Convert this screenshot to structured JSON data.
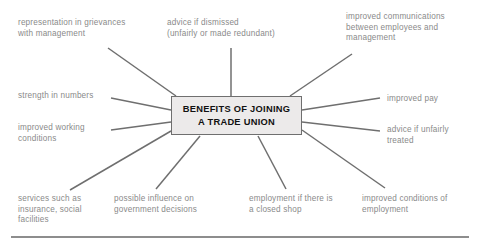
{
  "diagram": {
    "type": "spider-mind-map",
    "center": {
      "title": "BENEFITS OF JOINING\nA TRADE UNION",
      "fill_color": "#eceaea",
      "border_color": "#6f6f6f",
      "text_color": "#111111"
    },
    "style": {
      "label_color": "#8a8a8a",
      "connector_color": "#6f6f6f",
      "background_color": "#ffffff",
      "rule_color": "#8d8d8d"
    },
    "branches": [
      {
        "id": "representation-in-grievances",
        "label": "representation in grievances\nwith management",
        "position": "top-left",
        "x": 18,
        "y": 18,
        "line": {
          "x1": 108,
          "y1": 48,
          "x2": 176,
          "y2": 96
        }
      },
      {
        "id": "advice-if-dismissed",
        "label": "advice if dismissed\n(unfairly or made redundant)",
        "position": "top-center",
        "x": 167,
        "y": 18,
        "line": {
          "x1": 231,
          "y1": 48,
          "x2": 231,
          "y2": 96
        }
      },
      {
        "id": "improved-communications",
        "label": "improved communications\nbetween employees and\nmanagement",
        "position": "top-right",
        "x": 346,
        "y": 12,
        "line": {
          "x1": 352,
          "y1": 54,
          "x2": 290,
          "y2": 96
        }
      },
      {
        "id": "strength-in-numbers",
        "label": "strength in numbers",
        "position": "left-upper",
        "x": 18,
        "y": 91,
        "line": {
          "x1": 111,
          "y1": 98,
          "x2": 171,
          "y2": 110
        }
      },
      {
        "id": "improved-working-conditions",
        "label": "improved working\nconditions",
        "position": "left-lower",
        "x": 18,
        "y": 123,
        "line": {
          "x1": 111,
          "y1": 130,
          "x2": 171,
          "y2": 122
        }
      },
      {
        "id": "improved-pay",
        "label": "improved pay",
        "position": "right-upper",
        "x": 387,
        "y": 94,
        "line": {
          "x1": 302,
          "y1": 110,
          "x2": 380,
          "y2": 98
        }
      },
      {
        "id": "advice-if-unfairly-treated",
        "label": "advice if unfairly\ntreated",
        "position": "right-lower",
        "x": 387,
        "y": 125,
        "line": {
          "x1": 302,
          "y1": 122,
          "x2": 380,
          "y2": 131
        }
      },
      {
        "id": "services-such-as-insurance",
        "label": "services such as\ninsurance, social\nfacilities",
        "position": "bottom-far-left",
        "x": 18,
        "y": 194,
        "line": {
          "x1": 70,
          "y1": 190,
          "x2": 171,
          "y2": 131
        }
      },
      {
        "id": "possible-influence-on-government",
        "label": "possible influence on\ngovernment decisions",
        "position": "bottom-left",
        "x": 114,
        "y": 194,
        "line": {
          "x1": 156,
          "y1": 189,
          "x2": 200,
          "y2": 136
        }
      },
      {
        "id": "employment-closed-shop",
        "label": "employment if there is\na closed shop",
        "position": "bottom-right",
        "x": 249,
        "y": 194,
        "line": {
          "x1": 286,
          "y1": 189,
          "x2": 258,
          "y2": 136
        }
      },
      {
        "id": "improved-conditions-of-employment",
        "label": "improved conditions of\nemployment",
        "position": "bottom-far-right",
        "x": 362,
        "y": 194,
        "line": {
          "x1": 385,
          "y1": 188,
          "x2": 302,
          "y2": 130
        }
      }
    ]
  }
}
